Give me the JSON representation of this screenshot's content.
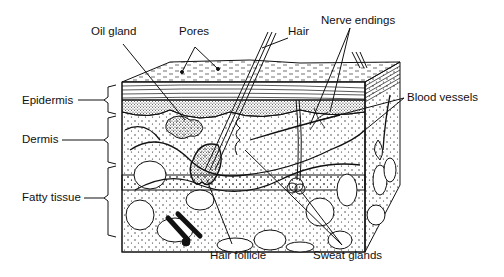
{
  "diagram": {
    "labels": {
      "oil_gland": "Oil gland",
      "pores": "Pores",
      "hair": "Hair",
      "nerve_endings": "Nerve endings",
      "blood_vessels": "Blood vessels",
      "epidermis": "Epidermis",
      "dermis": "Dermis",
      "fatty_tissue": "Fatty tissue",
      "hair_follicle": "Hair follicle",
      "sweat_glands": "Sweat glands"
    },
    "layers": [
      "Epidermis",
      "Dermis",
      "Fatty tissue"
    ],
    "colors": {
      "ink": "#111111",
      "background": "#ffffff"
    }
  }
}
